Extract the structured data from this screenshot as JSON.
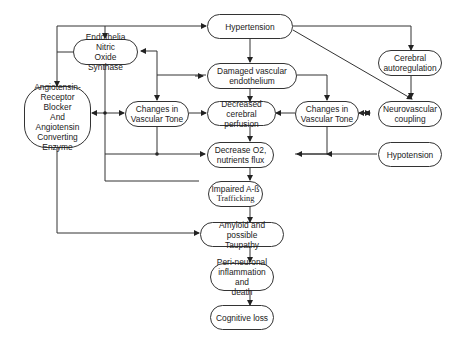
{
  "diagram": {
    "nodes": {
      "hypertension": "Hypertension",
      "enos": "Endothelia Nitric\nOxide Synthase",
      "cerebral_autoreg": "Cerebral\nautoregulation",
      "damaged_endo": "Damaged vascular\nendothelium",
      "arb_ace": "Angiotensin-\nReceptor Blocker\nAnd\nAngiotensin\nConverting\nEnzyme",
      "vascular_tone_left": "Changes in\nVascular Tone",
      "decreased_perfusion": "Decreased\ncerebral perfusion",
      "vascular_tone_right": "Changes in\nVascular Tone",
      "neurovascular": "Neurovascular\ncoupling",
      "decrease_o2": "Decrease O2,\nnutrients flux",
      "hypotension": "Hypotension",
      "impaired_ab_line1": "Impaired A-ß",
      "impaired_ab_line2": "Trafficking",
      "amyloid": "Amyloid and possible\nTaupathy",
      "inflammation": "Peri-neuronal\ninflammation and\ndeath",
      "cognitive_loss": "Cognitive loss"
    },
    "edges": [
      {
        "from": "Hypertension",
        "to": "Endothelia Nitric Oxide Synthase"
      },
      {
        "from": "Hypertension",
        "to": "Angiotensin-Receptor Blocker And Angiotensin Converting Enzyme"
      },
      {
        "from": "Hypertension",
        "to": "Damaged vascular endothelium"
      },
      {
        "from": "Hypertension",
        "to": "Cerebral autoregulation"
      },
      {
        "from": "Hypertension",
        "to": "Neurovascular coupling"
      },
      {
        "from": "Cerebral autoregulation",
        "to": "Neurovascular coupling"
      },
      {
        "from": "Damaged vascular endothelium",
        "to": "Decreased cerebral perfusion"
      },
      {
        "from": "Damaged vascular endothelium",
        "to": "Endothelia Nitric Oxide Synthase"
      },
      {
        "from": "Damaged vascular endothelium",
        "to": "Changes in Vascular Tone (left)"
      },
      {
        "from": "Damaged vascular endothelium",
        "to": "Changes in Vascular Tone (right)"
      },
      {
        "from": "Endothelia Nitric Oxide Synthase",
        "to": "Angiotensin-Receptor Blocker / Changes in Vascular Tone (left)"
      },
      {
        "from": "Changes in Vascular Tone (left)",
        "to": "Decreased cerebral perfusion"
      },
      {
        "from": "Changes in Vascular Tone (right)",
        "to": "Decreased cerebral perfusion"
      },
      {
        "from": "Changes in Vascular Tone (right)",
        "to": "Neurovascular coupling",
        "bidirectional": true
      },
      {
        "from": "Changes in Vascular Tone (left)",
        "to": "Decrease O2, nutrients flux"
      },
      {
        "from": "Changes in Vascular Tone (right)",
        "to": "Decrease O2, nutrients flux"
      },
      {
        "from": "Hypotension",
        "to": "Decrease O2, nutrients flux"
      },
      {
        "from": "Decreased cerebral perfusion",
        "to": "Decrease O2, nutrients flux"
      },
      {
        "from": "Decrease O2, nutrients flux",
        "to": "Impaired A-ß Trafficking"
      },
      {
        "from": "Impaired A-ß Trafficking",
        "to": "Amyloid and possible Taupathy"
      },
      {
        "from": "Angiotensin-Receptor Blocker And Angiotensin Converting Enzyme",
        "to": "Amyloid and possible Taupathy"
      },
      {
        "from": "Amyloid and possible Taupathy",
        "to": "Peri-neuronal inflammation and death"
      },
      {
        "from": "Peri-neuronal inflammation and death",
        "to": "Cognitive loss"
      }
    ]
  }
}
